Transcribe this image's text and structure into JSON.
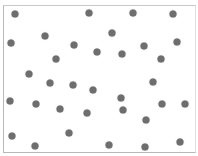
{
  "chart_data": {
    "type": "scatter",
    "title": "",
    "xlabel": "",
    "ylabel": "",
    "grid": false,
    "legend": null,
    "dot_color": "#6e6e6e",
    "points": [
      {
        "x": 15,
        "y": 14
      },
      {
        "x": 89,
        "y": 13
      },
      {
        "x": 133,
        "y": 13
      },
      {
        "x": 173,
        "y": 14
      },
      {
        "x": 11,
        "y": 43
      },
      {
        "x": 45,
        "y": 36
      },
      {
        "x": 112,
        "y": 33
      },
      {
        "x": 74,
        "y": 45
      },
      {
        "x": 177,
        "y": 42
      },
      {
        "x": 56,
        "y": 59
      },
      {
        "x": 97,
        "y": 52
      },
      {
        "x": 122,
        "y": 54
      },
      {
        "x": 144,
        "y": 46
      },
      {
        "x": 161,
        "y": 59
      },
      {
        "x": 29,
        "y": 74
      },
      {
        "x": 50,
        "y": 83
      },
      {
        "x": 73,
        "y": 85
      },
      {
        "x": 93,
        "y": 90
      },
      {
        "x": 153,
        "y": 82
      },
      {
        "x": 10,
        "y": 101
      },
      {
        "x": 36,
        "y": 104
      },
      {
        "x": 60,
        "y": 109
      },
      {
        "x": 87,
        "y": 113
      },
      {
        "x": 121,
        "y": 98
      },
      {
        "x": 123,
        "y": 110
      },
      {
        "x": 162,
        "y": 104
      },
      {
        "x": 185,
        "y": 104
      },
      {
        "x": 146,
        "y": 120
      },
      {
        "x": 12,
        "y": 136
      },
      {
        "x": 69,
        "y": 133
      },
      {
        "x": 35,
        "y": 146
      },
      {
        "x": 109,
        "y": 145
      },
      {
        "x": 145,
        "y": 147
      },
      {
        "x": 180,
        "y": 142
      }
    ]
  }
}
